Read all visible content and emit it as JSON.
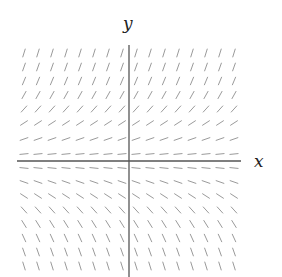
{
  "diagram": {
    "type": "slope_field",
    "axes": {
      "x_label": "x",
      "y_label": "y",
      "color": "#555555"
    },
    "segment_color": "#9a9a9a",
    "grid": {
      "columns": 16,
      "rows": 16,
      "x_start_px": 24,
      "x_step_px": 14,
      "row_y_px": [
        53,
        67,
        81,
        95,
        109,
        123,
        139,
        154,
        168,
        182,
        196,
        210,
        224,
        238,
        252,
        266
      ],
      "row_slopes": [
        3.2,
        2.8,
        2.4,
        1.8,
        1.1,
        0.65,
        0.35,
        0.1,
        -0.1,
        -0.35,
        -0.65,
        -1.1,
        -1.6,
        -2.2,
        -2.8,
        -3.2
      ]
    }
  },
  "chart_data": {
    "type": "slope_field",
    "title": "",
    "xlabel": "x",
    "ylabel": "y",
    "grid": false,
    "legend": "none",
    "rule": "slope depends only on y; positive above x-axis, negative below, steeper as |y| grows",
    "rows_top_to_bottom_slopes": [
      3.2,
      2.8,
      2.4,
      1.8,
      1.1,
      0.65,
      0.35,
      0.1,
      -0.1,
      -0.35,
      -0.65,
      -1.1,
      -1.6,
      -2.2,
      -2.8,
      -3.2
    ],
    "columns": 16
  }
}
